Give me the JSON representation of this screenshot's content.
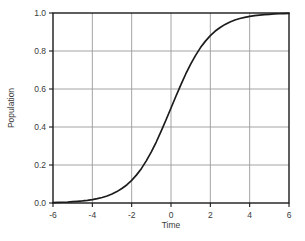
{
  "chart_data": {
    "type": "line",
    "title": "",
    "subtitle": "",
    "xlabel": "Time",
    "ylabel": "Population",
    "xlim": [
      -6,
      6
    ],
    "ylim": [
      0.0,
      1.0
    ],
    "grid": true,
    "legend": false,
    "legend_position": "none",
    "xticks": [
      -6,
      -4,
      -2,
      0,
      2,
      4,
      6
    ],
    "xtick_labels": [
      "-6",
      "-4",
      "-2",
      "0",
      "2",
      "4",
      "6"
    ],
    "yticks": [
      0.0,
      0.2,
      0.4,
      0.6,
      0.8,
      1.0
    ],
    "ytick_labels": [
      "0.0",
      "0.2",
      "0.4",
      "0.6",
      "0.8",
      "1.0"
    ],
    "curve_color": "#1c1c1c",
    "grid_color": "#9a9a9a",
    "axis_color": "#1a1a1a",
    "background_color": "#ffffff",
    "series": [
      {
        "name": "Logistic growth",
        "x": [
          -6.0,
          -5.75,
          -5.5,
          -5.25,
          -5.0,
          -4.75,
          -4.5,
          -4.25,
          -4.0,
          -3.75,
          -3.5,
          -3.25,
          -3.0,
          -2.75,
          -2.5,
          -2.25,
          -2.0,
          -1.75,
          -1.5,
          -1.25,
          -1.0,
          -0.75,
          -0.5,
          -0.25,
          0.0,
          0.25,
          0.5,
          0.75,
          1.0,
          1.25,
          1.5,
          1.75,
          2.0,
          2.25,
          2.5,
          2.75,
          3.0,
          3.25,
          3.5,
          3.75,
          4.0,
          4.25,
          4.5,
          4.75,
          5.0,
          5.25,
          5.5,
          5.75,
          6.0
        ],
        "y": [
          0.002,
          0.003,
          0.004,
          0.005,
          0.007,
          0.009,
          0.011,
          0.014,
          0.018,
          0.023,
          0.029,
          0.037,
          0.047,
          0.06,
          0.076,
          0.095,
          0.119,
          0.148,
          0.182,
          0.223,
          0.269,
          0.321,
          0.378,
          0.438,
          0.5,
          0.562,
          0.622,
          0.679,
          0.731,
          0.777,
          0.818,
          0.852,
          0.881,
          0.905,
          0.924,
          0.94,
          0.953,
          0.963,
          0.971,
          0.977,
          0.982,
          0.986,
          0.989,
          0.991,
          0.993,
          0.995,
          0.996,
          0.997,
          0.998
        ]
      }
    ]
  },
  "plot_geometry": {
    "left": 53,
    "right": 289,
    "top": 13,
    "bottom": 203
  }
}
